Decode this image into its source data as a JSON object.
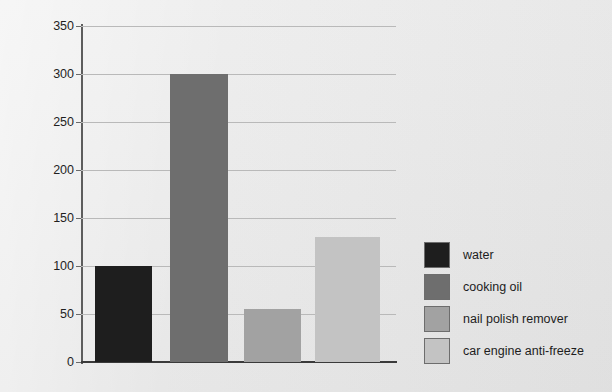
{
  "chart_data": {
    "type": "bar",
    "title": "",
    "xlabel": "",
    "ylabel": "Temperature (°C)",
    "categories": [
      "water",
      "cooking oil",
      "nail polish remover",
      "car engine anti-freeze"
    ],
    "values": [
      100,
      300,
      55,
      130
    ],
    "ylim": [
      0,
      350
    ],
    "y_ticks": [
      0,
      50,
      100,
      150,
      200,
      250,
      300,
      350
    ],
    "y_tick_labels": [
      "0",
      "50",
      "100",
      "150",
      "200",
      "250",
      "300",
      "350"
    ],
    "grid": "horizontal",
    "legend_position": "right",
    "series": [
      {
        "name": "water",
        "value": 100,
        "color": "#1e1e1e"
      },
      {
        "name": "cooking oil",
        "value": 300,
        "color": "#6e6e6e"
      },
      {
        "name": "nail polish remover",
        "value": 55,
        "color": "#a2a2a2"
      },
      {
        "name": "car engine anti-freeze",
        "value": 130,
        "color": "#c3c3c3"
      }
    ]
  },
  "legend": {
    "items": [
      {
        "label": "water",
        "color": "#1e1e1e"
      },
      {
        "label": "cooking oil",
        "color": "#6e6e6e"
      },
      {
        "label": "nail polish remover",
        "color": "#a2a2a2"
      },
      {
        "label": "car engine anti-freeze",
        "color": "#c3c3c3"
      }
    ]
  },
  "colors": {
    "background": "#e9e9e9",
    "axis": "#3a3a3a",
    "gridline": "#b9b9b9",
    "text": "#1c1c1c"
  }
}
